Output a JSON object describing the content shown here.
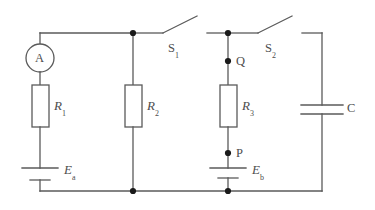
{
  "diagram": {
    "type": "electrical-schematic",
    "background_color": "#ffffff",
    "wire_color": "#5a5a5a",
    "node_color": "#1a1a1a"
  },
  "components": {
    "ammeter": {
      "symbol": "A",
      "name": "ammeter",
      "shape": "circle"
    },
    "resistor_1": {
      "label_main": "R",
      "label_sub": "1",
      "name": "resistor-r1"
    },
    "resistor_2": {
      "label_main": "R",
      "label_sub": "2",
      "name": "resistor-r2"
    },
    "resistor_3": {
      "label_main": "R",
      "label_sub": "3",
      "name": "resistor-r3"
    },
    "battery_a": {
      "label_main": "E",
      "label_sub": "a",
      "name": "battery-ea"
    },
    "battery_b": {
      "label_main": "E",
      "label_sub": "b",
      "name": "battery-eb"
    },
    "capacitor": {
      "label_main": "C",
      "name": "capacitor-c"
    },
    "switch_1": {
      "label_main": "S",
      "label_sub": "1",
      "name": "switch-s1",
      "state": "open"
    },
    "switch_2": {
      "label_main": "S",
      "label_sub": "2",
      "name": "switch-s2",
      "state": "open"
    }
  },
  "nodes": {
    "point_q": {
      "label": "Q"
    },
    "point_p": {
      "label": "P"
    }
  }
}
